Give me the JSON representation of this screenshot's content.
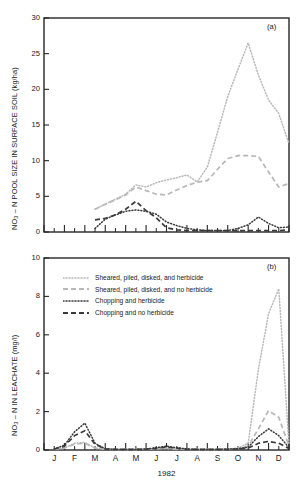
{
  "figure": {
    "xaxis_title": "1982",
    "months": [
      "J",
      "F",
      "M",
      "A",
      "M",
      "J",
      "J",
      "A",
      "S",
      "O",
      "N",
      "D"
    ],
    "colors": {
      "axis": "#262626",
      "text": "#1a1a1a",
      "series_light": "#b8b8b8",
      "series_dark": "#3a3a3a",
      "background": "#ffffff"
    },
    "legend": {
      "entries": [
        {
          "label": "Sheared, piled, disked, and herbicide",
          "style": "dotted",
          "color": "#b8b8b8",
          "swatch_name": "legend-swatch-sheared-herbicide"
        },
        {
          "label": "Sheared, piled, disked, and no herbicide",
          "style": "dashed",
          "color": "#b8b8b8",
          "swatch_name": "legend-swatch-sheared-no-herbicide"
        },
        {
          "label": "Chopping and herbicide",
          "style": "dotted",
          "color": "#3a3a3a",
          "swatch_name": "legend-swatch-chopping-herbicide"
        },
        {
          "label": "Chopping and no herbicide",
          "style": "dashed",
          "color": "#3a3a3a",
          "swatch_name": "legend-swatch-chopping-no-herbicide"
        }
      ]
    },
    "panel_a": {
      "tag": "(a)",
      "ylabel_main": "NO",
      "ylabel_sub": "3",
      "ylabel_rest": " – N POOL SIZE IN SURFACE SOIL (kg/ha)",
      "ytick_labels": [
        "0",
        "5",
        "10",
        "15",
        "20",
        "25",
        "30"
      ]
    },
    "panel_b": {
      "tag": "(b)",
      "ylabel_main": "NO",
      "ylabel_sub": "3",
      "ylabel_rest": " – N IN LEACHATE (mg/l)",
      "ytick_labels": [
        "0",
        "2",
        "4",
        "6",
        "8",
        "10"
      ]
    }
  },
  "chart_data": [
    {
      "type": "line",
      "panel": "a",
      "title": "",
      "xlabel": "1982",
      "ylabel": "NO3 – N POOL SIZE IN SURFACE SOIL (kg/ha)",
      "xlim": [
        0,
        12
      ],
      "ylim": [
        0,
        30
      ],
      "yticks": [
        0,
        5,
        10,
        15,
        20,
        25,
        30
      ],
      "grid": false,
      "x": [
        2.5,
        3.0,
        3.5,
        4.0,
        4.5,
        5.0,
        5.5,
        6.0,
        6.5,
        7.0,
        7.5,
        8.0,
        8.5,
        9.0,
        9.5,
        10.0,
        10.5,
        11.0,
        11.5,
        12.0
      ],
      "x_month_labels": [
        "Mar",
        "Mar",
        "Apr",
        "Apr",
        "May",
        "May",
        "Jun",
        "Jun",
        "Jul",
        "Jul",
        "Aug",
        "Aug",
        "Sep",
        "Sep",
        "Oct",
        "Oct",
        "Nov",
        "Nov",
        "Dec",
        "Dec"
      ],
      "series": [
        {
          "name": "Sheared, piled, disked, and herbicide",
          "style": "dotted",
          "color": "#b8b8b8",
          "values": [
            3.2,
            3.9,
            4.6,
            5.3,
            6.6,
            6.3,
            6.9,
            7.3,
            7.6,
            8.0,
            7.0,
            9.1,
            14.0,
            19.0,
            22.8,
            26.5,
            22.0,
            18.5,
            16.6,
            12.4
          ]
        },
        {
          "name": "Sheared, piled, disked, and no herbicide",
          "style": "dashed",
          "color": "#b8b8b8",
          "values": [
            3.2,
            3.9,
            4.5,
            5.2,
            6.3,
            5.8,
            5.3,
            5.2,
            5.9,
            6.5,
            7.0,
            7.2,
            8.8,
            10.3,
            10.7,
            10.7,
            10.6,
            8.4,
            6.3,
            6.8
          ]
        },
        {
          "name": "Chopping and herbicide",
          "style": "dotted",
          "color": "#3a3a3a",
          "values": [
            0.5,
            1.8,
            2.4,
            2.9,
            3.1,
            2.9,
            2.5,
            1.4,
            0.9,
            0.5,
            0.3,
            0.2,
            0.2,
            0.2,
            0.5,
            1.0,
            2.1,
            1.2,
            0.6,
            0.7
          ]
        },
        {
          "name": "Chopping and no herbicide",
          "style": "dashed",
          "color": "#3a3a3a",
          "values": [
            1.7,
            1.9,
            2.4,
            3.2,
            4.3,
            3.0,
            2.0,
            0.6,
            0.3,
            0.2,
            0.2,
            0.2,
            0.2,
            0.2,
            0.2,
            0.2,
            0.2,
            0.2,
            0.2,
            0.3
          ]
        }
      ]
    },
    {
      "type": "line",
      "panel": "b",
      "title": "",
      "xlabel": "1982",
      "ylabel": "NO3 – N IN LEACHATE (mg/l)",
      "xlim": [
        0,
        12
      ],
      "ylim": [
        0,
        10
      ],
      "yticks": [
        0,
        2,
        4,
        6,
        8,
        10
      ],
      "grid": false,
      "x": [
        0.5,
        1.0,
        1.5,
        2.0,
        2.5,
        3.0,
        3.5,
        4.0,
        4.5,
        5.0,
        5.5,
        6.0,
        6.5,
        7.0,
        7.5,
        8.0,
        8.5,
        9.0,
        9.5,
        10.0,
        10.5,
        11.0,
        11.5,
        12.0
      ],
      "series": [
        {
          "name": "Sheared, piled, disked, and herbicide",
          "style": "dotted",
          "color": "#b8b8b8",
          "values": [
            0.05,
            0.1,
            0.35,
            0.4,
            0.1,
            0.05,
            0.03,
            0.03,
            0.03,
            0.05,
            0.08,
            0.1,
            0.06,
            0.04,
            0.03,
            0.03,
            0.03,
            0.05,
            0.1,
            0.35,
            4.2,
            7.1,
            8.4,
            0.25
          ]
        },
        {
          "name": "Sheared, piled, disked, and no herbicide",
          "style": "dashed",
          "color": "#b8b8b8",
          "values": [
            0.05,
            0.1,
            0.3,
            0.35,
            0.1,
            0.05,
            0.03,
            0.03,
            0.03,
            0.05,
            0.07,
            0.08,
            0.05,
            0.04,
            0.03,
            0.03,
            0.03,
            0.04,
            0.08,
            0.2,
            1.1,
            2.05,
            1.7,
            0.2
          ]
        },
        {
          "name": "Chopping and herbicide",
          "style": "dotted",
          "color": "#3a3a3a",
          "values": [
            0.05,
            0.25,
            0.95,
            1.4,
            0.35,
            0.06,
            0.03,
            0.03,
            0.03,
            0.05,
            0.12,
            0.2,
            0.12,
            0.05,
            0.03,
            0.03,
            0.03,
            0.04,
            0.07,
            0.15,
            0.7,
            1.1,
            0.75,
            0.12
          ]
        },
        {
          "name": "Chopping and no herbicide",
          "style": "dashed",
          "color": "#3a3a3a",
          "values": [
            0.05,
            0.2,
            0.75,
            1.0,
            0.3,
            0.05,
            0.03,
            0.03,
            0.03,
            0.04,
            0.1,
            0.15,
            0.1,
            0.04,
            0.03,
            0.03,
            0.03,
            0.03,
            0.05,
            0.1,
            0.35,
            0.45,
            0.35,
            0.08
          ]
        }
      ]
    }
  ]
}
